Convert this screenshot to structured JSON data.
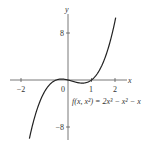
{
  "chart_data": {
    "type": "line",
    "title": "",
    "function_label": "f(x, x²) = 2x³ − x² − x",
    "function": "2x^3 - x^2 - x",
    "xlabel": "x",
    "ylabel": "y",
    "xlim": [
      -2,
      2
    ],
    "ylim": [
      -8,
      8
    ],
    "x_ticks": [
      -2,
      0,
      1,
      2
    ],
    "x_tick_labels": [
      "−2",
      "0",
      "1",
      "2"
    ],
    "y_ticks": [
      8,
      -8
    ],
    "y_tick_labels": [
      "8",
      "−8"
    ],
    "grid": false,
    "series": [
      {
        "name": "f(x) = 2x^3 - x^2 - x",
        "x": [
          -1.7,
          -1.5,
          -1.0,
          -0.5,
          -0.25,
          0,
          0.25,
          0.5,
          0.75,
          1.0,
          1.25,
          1.5,
          1.75,
          2.0
        ],
        "values": [
          -11.0,
          -7.5,
          -2.0,
          0.0,
          0.156,
          0,
          -0.281,
          -0.5,
          -0.469,
          0.0,
          1.094,
          3.0,
          5.906,
          10.0
        ]
      }
    ],
    "color": "#222222"
  },
  "axes": {
    "x_label": "x",
    "y_label": "y",
    "x_tick_labels": [
      "−2",
      "0",
      "1",
      "2"
    ],
    "y_tick_labels": [
      "8",
      "−8"
    ]
  },
  "annotation": "f(x, x²) = 2x³ − x² − x"
}
